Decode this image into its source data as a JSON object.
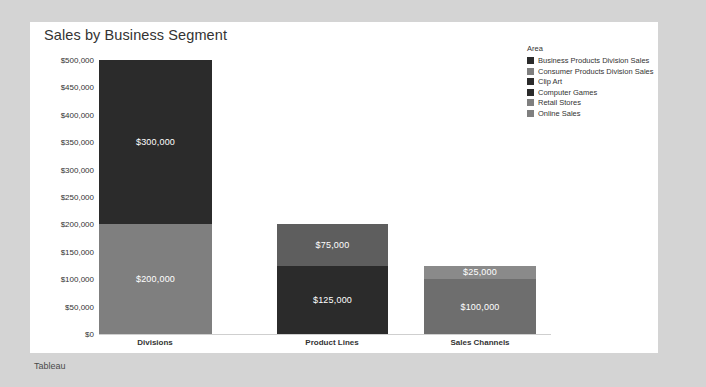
{
  "viz": {
    "title": "Sales by Business Segment",
    "footer": "Tableau",
    "panel_bg": "#ffffff",
    "page_bg": "#d4d4d4"
  },
  "legend": {
    "title": "Area",
    "items": [
      {
        "label": "Business Products Division Sales",
        "color": "#2b2b2b"
      },
      {
        "label": "Consumer Products Division Sales",
        "color": "#7f7f7f"
      },
      {
        "label": "Clip Art",
        "color": "#2b2b2b"
      },
      {
        "label": "Computer Games",
        "color": "#2b2b2b"
      },
      {
        "label": "Retail Stores",
        "color": "#7f7f7f"
      },
      {
        "label": "Online Sales",
        "color": "#7f7f7f"
      }
    ]
  },
  "chart_data": {
    "type": "bar",
    "subtype": "stacked",
    "title": "Sales by Business Segment",
    "xlabel": "",
    "ylabel": "",
    "ylim": [
      0,
      500000
    ],
    "ytick_values": [
      0,
      50000,
      100000,
      150000,
      200000,
      250000,
      300000,
      350000,
      400000,
      450000,
      500000
    ],
    "ytick_labels": [
      "$0",
      "$50,000",
      "$100,000",
      "$150,000",
      "$200,000",
      "$250,000",
      "$300,000",
      "$350,000",
      "$400,000",
      "$450,000",
      "$500,000"
    ],
    "grid": false,
    "legend_position": "right",
    "categories": [
      "Divisions",
      "Product Lines",
      "Sales Channels"
    ],
    "series": [
      {
        "name": "lower",
        "values": [
          200000,
          125000,
          100000
        ],
        "labels": [
          "$200,000",
          "$125,000",
          "$100,000"
        ],
        "colors": [
          "#7f7f7f",
          "#2b2b2b",
          "#6e6e6e"
        ],
        "label_colors": [
          "#ffffff",
          "#ffffff",
          "#ffffff"
        ]
      },
      {
        "name": "upper",
        "values": [
          300000,
          75000,
          25000
        ],
        "labels": [
          "$300,000",
          "$75,000",
          "$25,000"
        ],
        "colors": [
          "#2b2b2b",
          "#5e5e5e",
          "#8a8a8a"
        ],
        "label_colors": [
          "#ffffff",
          "#ffffff",
          "#ffffff"
        ]
      }
    ],
    "totals": [
      500000,
      200000,
      125000
    ],
    "bar_geometry": [
      {
        "left": 0,
        "width": 113,
        "center": 56
      },
      {
        "left": 178,
        "width": 111,
        "center": 233
      },
      {
        "left": 325,
        "width": 112,
        "center": 381
      }
    ]
  }
}
